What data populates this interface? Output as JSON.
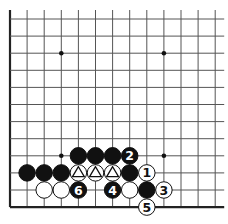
{
  "diagram": {
    "type": "go-board-fragment",
    "grid": {
      "origin_x": 10,
      "origin_y": 19,
      "spacing": 17.1,
      "cols": 13,
      "rows": 12,
      "left_edge": true,
      "bottom_edge": true,
      "top_extend": 9,
      "right_extend": 9
    },
    "star_points": [
      [
        3,
        2
      ],
      [
        9,
        2
      ],
      [
        3,
        8
      ],
      [
        9,
        8
      ]
    ],
    "stones": [
      {
        "col": 4,
        "row": 8,
        "color": "black",
        "label": ""
      },
      {
        "col": 5,
        "row": 8,
        "color": "black",
        "label": ""
      },
      {
        "col": 6,
        "row": 8,
        "color": "black",
        "label": ""
      },
      {
        "col": 7,
        "row": 8,
        "color": "black",
        "label": "2"
      },
      {
        "col": 1,
        "row": 9,
        "color": "black",
        "label": ""
      },
      {
        "col": 2,
        "row": 9,
        "color": "black",
        "label": ""
      },
      {
        "col": 3,
        "row": 9,
        "color": "black",
        "label": ""
      },
      {
        "col": 4,
        "row": 9,
        "color": "white",
        "label": "triangle"
      },
      {
        "col": 5,
        "row": 9,
        "color": "white",
        "label": "triangle"
      },
      {
        "col": 6,
        "row": 9,
        "color": "white",
        "label": "triangle"
      },
      {
        "col": 7,
        "row": 9,
        "color": "black",
        "label": ""
      },
      {
        "col": 8,
        "row": 9,
        "color": "white",
        "label": "1"
      },
      {
        "col": 2,
        "row": 10,
        "color": "white",
        "label": ""
      },
      {
        "col": 3,
        "row": 10,
        "color": "white",
        "label": ""
      },
      {
        "col": 4,
        "row": 10,
        "color": "black",
        "label": "6"
      },
      {
        "col": 6,
        "row": 10,
        "color": "black",
        "label": "4"
      },
      {
        "col": 7,
        "row": 10,
        "color": "white",
        "label": ""
      },
      {
        "col": 8,
        "row": 10,
        "color": "black",
        "label": ""
      },
      {
        "col": 9,
        "row": 10,
        "color": "white",
        "label": "3"
      },
      {
        "col": 8,
        "row": 11,
        "color": "white",
        "label": "5"
      }
    ],
    "colors": {
      "line": "#555555",
      "edge": "#222222",
      "black": "#111111",
      "white": "#ffffff"
    }
  }
}
